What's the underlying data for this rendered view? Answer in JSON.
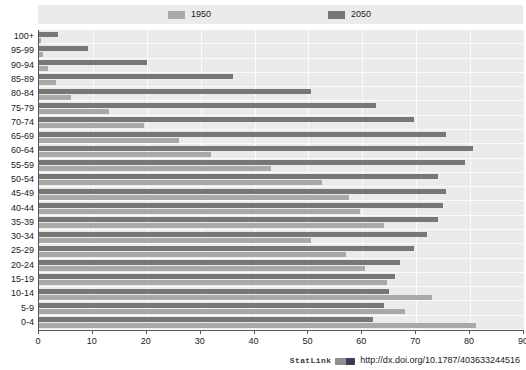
{
  "legend": {
    "items": [
      {
        "label": "1950",
        "color": "#a9a9a9"
      },
      {
        "label": "2050",
        "color": "#777777"
      }
    ]
  },
  "footer": {
    "statlink_label": "StatLink",
    "statlink_icon": "statlink-icon",
    "doi_url": "http://dx.doi.org/10.1787/403633244516"
  },
  "chart_data": {
    "type": "bar",
    "orientation": "horizontal",
    "title": "",
    "subtitle": "",
    "xlabel": "",
    "ylabel": "",
    "xlim": [
      0,
      90
    ],
    "ylim": null,
    "grid": true,
    "legend_position": "top",
    "xticks": [
      0,
      10,
      20,
      30,
      40,
      50,
      60,
      70,
      80,
      90
    ],
    "categories": [
      "100+",
      "95-99",
      "90-94",
      "85-89",
      "80-84",
      "75-79",
      "70-74",
      "65-69",
      "60-64",
      "55-59",
      "50-54",
      "45-49",
      "40-44",
      "35-39",
      "30-34",
      "25-29",
      "20-24",
      "15-19",
      "10-14",
      "5-9",
      "0-4"
    ],
    "series": [
      {
        "name": "2050",
        "color": "#777777",
        "values": [
          3.5,
          9.0,
          20.0,
          36.0,
          50.5,
          62.5,
          69.5,
          75.5,
          80.5,
          79.0,
          74.0,
          75.5,
          75.0,
          74.0,
          72.0,
          69.5,
          67.0,
          66.0,
          65.0,
          64.0,
          62.0
        ]
      },
      {
        "name": "1950",
        "color": "#a9a9a9",
        "values": [
          0.3,
          0.8,
          1.6,
          3.2,
          6.0,
          13.0,
          19.5,
          26.0,
          32.0,
          43.0,
          52.5,
          57.5,
          59.5,
          64.0,
          50.5,
          57.0,
          60.5,
          64.5,
          73.0,
          68.0,
          81.0
        ]
      }
    ]
  }
}
